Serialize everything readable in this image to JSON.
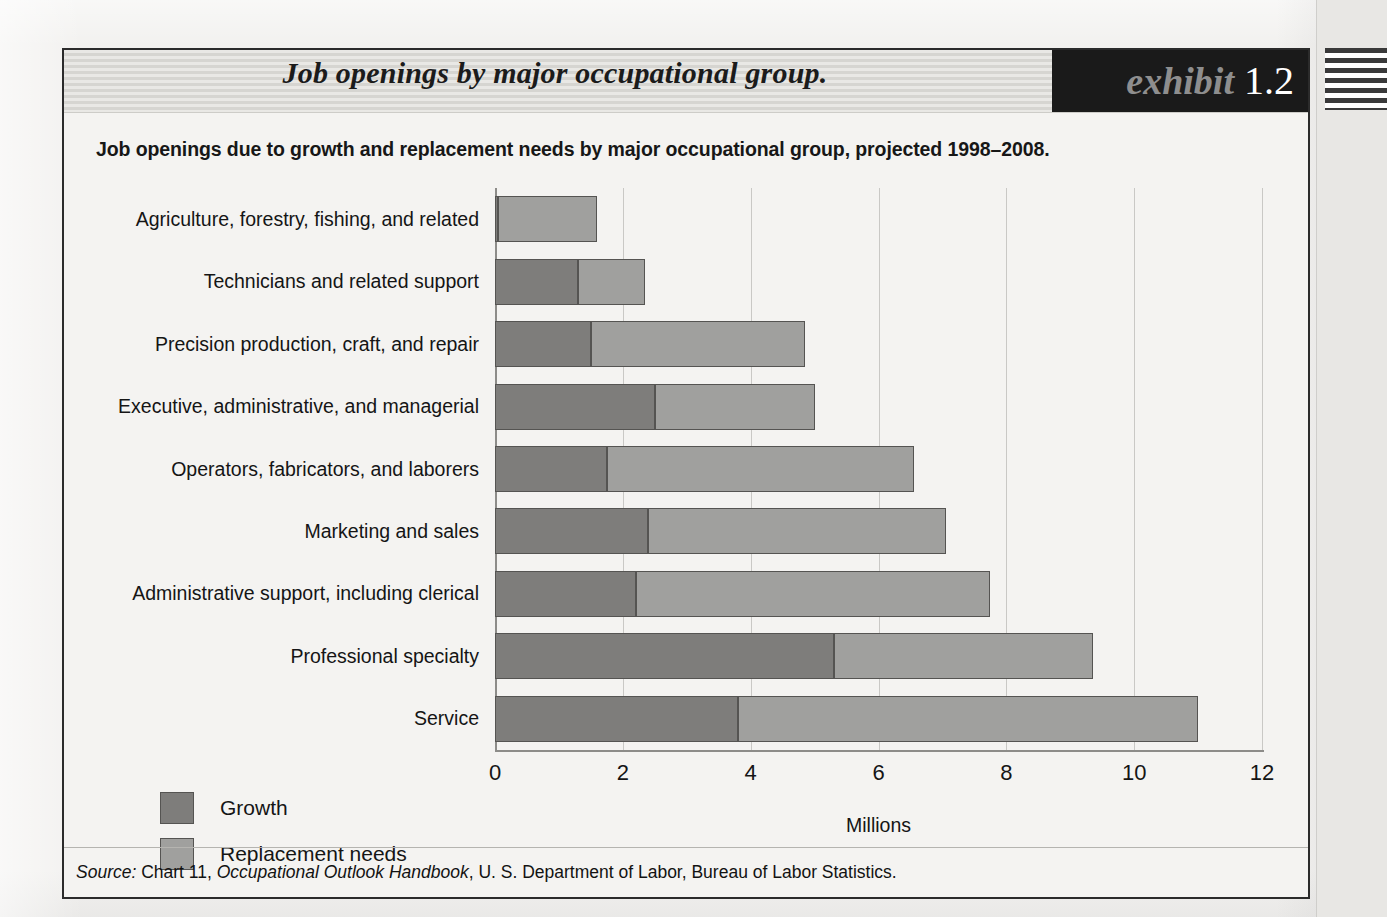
{
  "exhibit": {
    "title": "Job openings by major occupational group.",
    "badge_word": "exhibit",
    "badge_number": "1.2",
    "subtitle": "Job openings due to growth and replacement needs by major occupational group, projected 1998–2008."
  },
  "source": {
    "lead": "Source:",
    "text_before_italic": " Chart 11, ",
    "italic": "Occupational Outlook Handbook",
    "text_after_italic": ", U. S. Department of Labor, Bureau of Labor Statistics."
  },
  "legend": {
    "items": [
      {
        "label": "Growth",
        "color": "#7e7d7b"
      },
      {
        "label": "Replacement needs",
        "color": "#a0a09e"
      }
    ]
  },
  "colors": {
    "growth": "#7e7d7b",
    "replacement": "#a0a09e",
    "badge_background": "#1a1a1a",
    "badge_word": "#8e8e8e",
    "badge_number": "#ffffff",
    "page": "#f4f3f1",
    "gridline": "#c9c8c5",
    "axis": "#8d8c89"
  },
  "chart_data": {
    "type": "bar",
    "orientation": "horizontal",
    "stacked": true,
    "title": "Job openings by major occupational group.",
    "subtitle": "Job openings due to growth and replacement needs by major occupational group, projected 1998–2008.",
    "xlabel": "Millions",
    "ylabel": "",
    "xlim": [
      0,
      12
    ],
    "xticks": [
      0,
      2,
      4,
      6,
      8,
      10,
      12
    ],
    "xtick_labels": [
      "0",
      "2",
      "4",
      "6",
      "8",
      "10",
      "12"
    ],
    "grid": "vertical",
    "legend_position": "bottom-left",
    "categories": [
      "Agriculture, forestry, fishing, and related",
      "Technicians and related support",
      "Precision production, craft, and repair",
      "Executive, administrative, and managerial",
      "Operators, fabricators, and laborers",
      "Marketing and sales",
      "Administrative support, including clerical",
      "Professional specialty",
      "Service"
    ],
    "series": [
      {
        "name": "Growth",
        "color": "#7e7d7b",
        "values": [
          0.05,
          1.3,
          1.5,
          2.5,
          1.75,
          2.4,
          2.2,
          5.3,
          3.8
        ]
      },
      {
        "name": "Replacement needs",
        "color": "#a0a09e",
        "values": [
          1.55,
          1.05,
          3.35,
          2.5,
          4.8,
          4.65,
          5.55,
          4.05,
          7.2
        ]
      }
    ],
    "totals": [
      1.6,
      2.35,
      4.85,
      5.0,
      6.55,
      7.05,
      7.75,
      9.35,
      11.0
    ],
    "units": "Millions of job openings"
  }
}
